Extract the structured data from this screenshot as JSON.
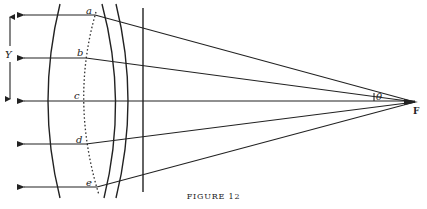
{
  "figure": {
    "caption": "FIGURE 12",
    "labels": {
      "a": "a",
      "b": "b",
      "c": "c",
      "d": "d",
      "e": "e",
      "Y": "Y",
      "theta": "θ",
      "F": "F"
    },
    "focal_point": {
      "x": 415,
      "y": 102
    },
    "rays": [
      {
        "label": "a",
        "y": 15,
        "bend_x": 95
      },
      {
        "label": "b",
        "y": 58,
        "bend_x": 86
      },
      {
        "label": "c",
        "y": 101,
        "bend_x": 82
      },
      {
        "label": "d",
        "y": 144,
        "bend_x": 86
      },
      {
        "label": "e",
        "y": 187,
        "bend_x": 97
      }
    ],
    "colors": {
      "ink": "#222222",
      "background": "#ffffff"
    }
  }
}
